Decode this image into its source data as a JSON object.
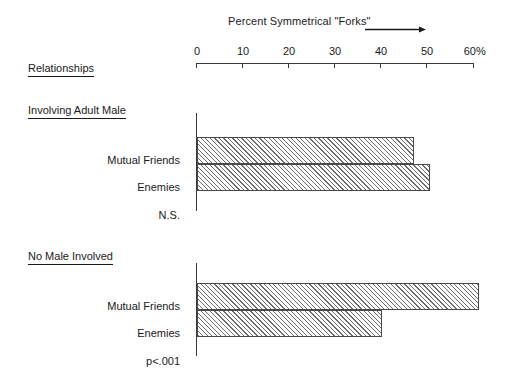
{
  "chart_data": {
    "type": "bar",
    "orientation": "horizontal",
    "title": "Percent Symmetrical \"Forks\"",
    "xlabel": "Percent Symmetrical \"Forks\"",
    "ylabel": "Relationships",
    "xlim": [
      0,
      60
    ],
    "xticks": [
      0,
      10,
      20,
      30,
      40,
      50,
      60
    ],
    "xticklabels": [
      "0",
      "10",
      "20",
      "30",
      "40",
      "50",
      "60%"
    ],
    "grid": false,
    "legend": false,
    "groups": [
      {
        "name": "Involving Adult Male",
        "significance": "N.S.",
        "categories": [
          "Mutual Friends",
          "Enemies"
        ],
        "values": [
          47,
          50.5
        ]
      },
      {
        "name": "No Male Involved",
        "significance": "p<.001",
        "categories": [
          "Mutual Friends",
          "Enemies"
        ],
        "values": [
          61,
          40
        ]
      }
    ],
    "colors": {
      "bar_edge": "#4a4a4a",
      "bar_hatch": "#6e6e6e",
      "axis": "#3a3a3a",
      "text": "#1a1a1a",
      "background": "#ffffff"
    }
  },
  "header": {
    "row_header": "Relationships"
  },
  "axis": {
    "title": "Percent Symmetrical \"Forks\"",
    "ticks": [
      {
        "label": "0",
        "x": 197
      },
      {
        "label": "10",
        "x": 243
      },
      {
        "label": "20",
        "x": 289
      },
      {
        "label": "30",
        "x": 335
      },
      {
        "label": "40",
        "x": 381
      },
      {
        "label": "50",
        "x": 427
      },
      {
        "label": "60%",
        "x": 473
      }
    ]
  },
  "group1": {
    "header": "Involving Adult Male",
    "bar_a_label": "Mutual Friends",
    "bar_b_label": "Enemies",
    "significance": "N.S."
  },
  "group2": {
    "header": "No Male Involved",
    "bar_a_label": "Mutual Friends",
    "bar_b_label": "Enemies",
    "significance": "p<.001"
  }
}
